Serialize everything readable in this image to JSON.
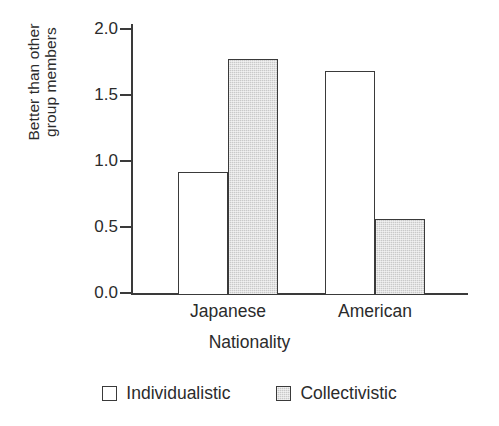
{
  "chart_data": {
    "type": "bar",
    "title": "",
    "subtitle": "",
    "xlabel": "Nationality",
    "ylabel_lines": [
      "Better than other",
      "group members"
    ],
    "ylabel": "Better than other group members",
    "categories": [
      "Japanese",
      "American"
    ],
    "series": [
      {
        "name": "Individualistic",
        "fill": "open",
        "values": [
          0.92,
          1.68
        ]
      },
      {
        "name": "Collectivistic",
        "fill": "filled",
        "values": [
          1.77,
          0.56
        ]
      }
    ],
    "ylim": [
      0.0,
      2.0
    ],
    "yticks": [
      0.0,
      0.5,
      1.0,
      1.5,
      2.0
    ],
    "ytick_labels": [
      "0.0",
      "0.5",
      "1.0",
      "1.5",
      "2.0"
    ],
    "grid": false,
    "legend_position": "bottom",
    "colors": {
      "axis": "#3a3a3a",
      "text": "#2b2b2b",
      "bar_open": "#ffffff",
      "bar_filled": "#c9c9c9",
      "background": "#ffffff"
    }
  },
  "legend": {
    "items": [
      {
        "label": "Individualistic",
        "style": "open"
      },
      {
        "label": "Collectivistic",
        "style": "filled"
      }
    ]
  }
}
